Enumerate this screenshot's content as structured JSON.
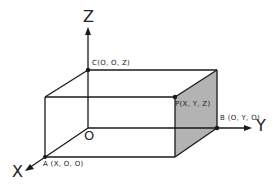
{
  "diagram": {
    "type": "3d-coordinate-box",
    "axes": {
      "x": "X",
      "y": "Y",
      "z": "Z"
    },
    "origin_label": "O",
    "points": {
      "A": "A (X,  O,  O)",
      "B": "B (O,  Y,  O)",
      "C": "C(O,  O,  Z)",
      "P": "P(X,  Y,  Z)"
    },
    "colors": {
      "line": "#1a1a1a",
      "shaded_face": "#b3b3b3",
      "background": "#ffffff"
    }
  }
}
